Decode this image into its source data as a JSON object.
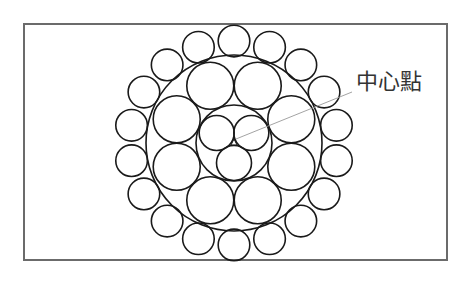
{
  "diagram": {
    "label": "中心點",
    "colors": {
      "stroke": "#1a1a1a",
      "frame": "#6b6b6b",
      "leader": "#999999",
      "background": "#ffffff"
    },
    "center": [
      234,
      143
    ],
    "layers": [
      {
        "name": "core",
        "count": 3,
        "strand_radius": 17.5,
        "ring_radius": 20,
        "boundary_radius": 38
      },
      {
        "name": "middle",
        "count": 8,
        "strand_radius": 23.5,
        "ring_radius": 62,
        "boundary_radius": 88
      },
      {
        "name": "outer",
        "count": 18,
        "strand_radius": 15.8,
        "ring_radius": 104
      }
    ],
    "leader_line": {
      "from": [
        236,
        139
      ],
      "to": [
        352,
        92
      ]
    }
  }
}
